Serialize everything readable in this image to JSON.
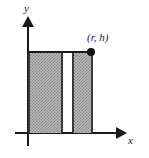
{
  "figure": {
    "background_color": "#ffffff",
    "stroke_color": "#1a1a1a",
    "shade_color": "#b9b9b9"
  },
  "axes": {
    "x_label": "x",
    "y_label": "y",
    "x_arrow_icon": "right-arrow-icon",
    "y_arrow_icon": "up-arrow-icon"
  },
  "annotations": {
    "corner_point_label": "(r, h)",
    "corner_point_icon": "filled-dot-icon"
  },
  "chart_data": {
    "type": "diagram",
    "regions": [
      {
        "name": "left-shaded-rect",
        "x_start": 0,
        "x_end": 0.55,
        "y_start": 0,
        "y_end": 1,
        "fill": "hatched-gray"
      },
      {
        "name": "gap",
        "x_start": 0.55,
        "x_end": 0.69,
        "y_start": 0,
        "y_end": 1,
        "fill": "none"
      },
      {
        "name": "right-shaded-rect",
        "x_start": 0.69,
        "x_end": 1.0,
        "y_start": 0,
        "y_end": 1,
        "fill": "hatched-gray"
      }
    ],
    "points": [
      {
        "label": "(r, h)",
        "x": "r",
        "y": "h"
      }
    ],
    "xlabel": "x",
    "ylabel": "y",
    "grid": false,
    "legend": "none"
  }
}
